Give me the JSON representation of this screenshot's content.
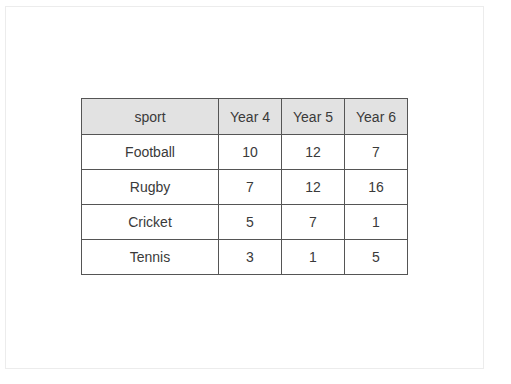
{
  "table": {
    "headers": [
      "sport",
      "Year 4",
      "Year 5",
      "Year 6"
    ],
    "rows": [
      {
        "sport": "Football",
        "year4": "10",
        "year5": "12",
        "year6": "7"
      },
      {
        "sport": "Rugby",
        "year4": "7",
        "year5": "12",
        "year6": "16"
      },
      {
        "sport": "Cricket",
        "year4": "5",
        "year5": "7",
        "year6": "1"
      },
      {
        "sport": "Tennis",
        "year4": "3",
        "year5": "1",
        "year6": "5"
      }
    ]
  },
  "colors": {
    "header_background": "#e2e2e2",
    "border": "#555555",
    "text": "#3a3a3a"
  }
}
